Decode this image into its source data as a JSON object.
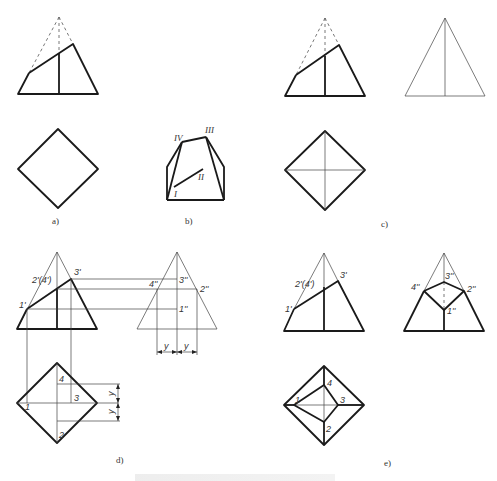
{
  "figure": {
    "panels": [
      {
        "id": "a",
        "label": "a)",
        "description": "Front view of cut pyramid and top view (square)"
      },
      {
        "id": "b",
        "label": "b)",
        "description": "Pictorial view of truncated pyramid",
        "points": [
          "I",
          "II",
          "III",
          "IV"
        ]
      },
      {
        "id": "c",
        "label": "c)",
        "description": "Complete three views of full pyramid with top view diagonals"
      },
      {
        "id": "d",
        "label": "d)",
        "description": "Locating points via projection lines and Y distances",
        "front_points": [
          "1'",
          "2'(4')",
          "3'"
        ],
        "side_points": [
          "4''",
          "3''",
          "2''",
          "1''"
        ],
        "top_points": [
          "1",
          "2",
          "3",
          "4"
        ],
        "dimension_label": "y"
      },
      {
        "id": "e",
        "label": "e)",
        "description": "Finished projections of the truncated pyramid",
        "front_points": [
          "1'",
          "2'(4')",
          "3'"
        ],
        "side_points": [
          "4''",
          "3''",
          "2''",
          "1''"
        ],
        "top_points": [
          "1",
          "2",
          "3",
          "4"
        ]
      }
    ],
    "caption": ""
  }
}
